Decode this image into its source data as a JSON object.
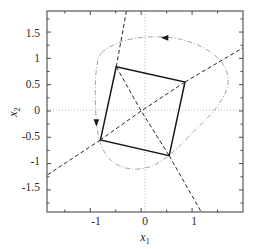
{
  "figure": {
    "top_fragment_text": "·  ·   ·    ·     ·      ·",
    "background_color": "#ffffff",
    "axis_color": "#4a4a4a",
    "grid_color": "#b5b5b5",
    "solid_color": "#1a1a1a",
    "dashed_color": "#1a1a1a",
    "dashdot_color": "#9a9a9a"
  },
  "chart_data": {
    "type": "line",
    "title": "",
    "xlabel": "x1",
    "ylabel": "x2",
    "xlim": [
      -1.85,
      2.0
    ],
    "ylim": [
      -1.92,
      1.9
    ],
    "xticks": [
      -1,
      0,
      1
    ],
    "xticklabels": [
      "-1",
      "0",
      "1"
    ],
    "yticks": [
      -1.5,
      -1,
      -0.5,
      0,
      0.5,
      1,
      1.5
    ],
    "yticklabels": [
      "-1.5",
      "-1",
      "-0.5",
      "0",
      "0.5",
      "1",
      "1.5"
    ],
    "grid": "dotted-zero-axes",
    "legend": "none",
    "series": [
      {
        "name": "invariant-set-polytope",
        "style": "solid",
        "closed": true,
        "points": [
          [
            -0.49,
            0.84
          ],
          [
            0.86,
            0.55
          ],
          [
            0.55,
            -0.85
          ],
          [
            -0.8,
            -0.55
          ]
        ]
      },
      {
        "name": "eigenvector-line-1",
        "style": "dashed",
        "closed": false,
        "points": [
          [
            -0.49,
            0.84
          ],
          [
            0.0,
            0.0
          ],
          [
            0.55,
            -0.85
          ]
        ]
      },
      {
        "name": "eigenvector-line-2",
        "style": "dashed",
        "closed": false,
        "points": [
          [
            0.86,
            0.55
          ],
          [
            0.0,
            0.0
          ],
          [
            -0.8,
            -0.55
          ]
        ]
      },
      {
        "name": "asymptote-line-steep",
        "style": "dashed",
        "closed": false,
        "points": [
          [
            -0.49,
            0.84
          ],
          [
            -0.29,
            1.9
          ]
        ]
      },
      {
        "name": "asymptote-line-steep-lower",
        "style": "dashed",
        "closed": false,
        "points": [
          [
            0.55,
            -0.85
          ],
          [
            1.18,
            -1.92
          ]
        ]
      },
      {
        "name": "asymptote-line-shallow-right",
        "style": "dashed",
        "closed": false,
        "points": [
          [
            0.86,
            0.55
          ],
          [
            2.0,
            1.2
          ]
        ]
      },
      {
        "name": "asymptote-line-shallow-left",
        "style": "dashed",
        "closed": false,
        "points": [
          [
            -0.8,
            -0.55
          ],
          [
            -1.85,
            -1.22
          ]
        ]
      },
      {
        "name": "trajectory-ellipse",
        "style": "dashdot",
        "closed": true,
        "points": [
          [
            -0.78,
            1.1
          ],
          [
            -0.35,
            1.33
          ],
          [
            0.2,
            1.41
          ],
          [
            0.78,
            1.36
          ],
          [
            1.28,
            1.17
          ],
          [
            1.62,
            0.87
          ],
          [
            1.7,
            0.48
          ],
          [
            1.45,
            0.03
          ],
          [
            1.0,
            -0.42
          ],
          [
            0.6,
            -0.8
          ],
          [
            0.2,
            -1.05
          ],
          [
            -0.22,
            -1.1
          ],
          [
            -0.58,
            -0.95
          ],
          [
            -0.8,
            -0.62
          ],
          [
            -0.88,
            -0.18
          ],
          [
            -0.9,
            0.35
          ],
          [
            -0.88,
            0.78
          ]
        ]
      }
    ],
    "markers": [
      {
        "name": "arrow-marker-top",
        "shape": "triangle-left",
        "position": [
          0.47,
          1.39
        ],
        "color": "#1a1a1a"
      },
      {
        "name": "arrow-marker-left",
        "shape": "triangle-down",
        "position": [
          -0.88,
          -0.22
        ],
        "color": "#1a1a1a"
      }
    ]
  }
}
